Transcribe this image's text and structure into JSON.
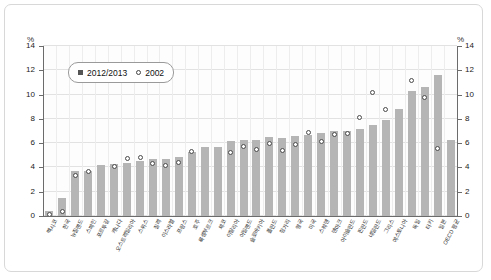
{
  "chart_data": {
    "type": "bar",
    "title": "",
    "xlabel": "",
    "ylabel": "%",
    "ylabel_right": "%",
    "ylim": [
      0,
      14
    ],
    "yticks": [
      0,
      2,
      4,
      6,
      8,
      10,
      12,
      14
    ],
    "grid": true,
    "legend_position": "top-left",
    "categories": [
      "멕시코",
      "한국",
      "뉴질랜드",
      "스페인",
      "포르투갈",
      "캐나다",
      "오스트레일리아",
      "스위스",
      "칠레",
      "이스라엘",
      "프랑스",
      "호주",
      "룩셈부르크",
      "체코",
      "이탈리아",
      "아일랜드",
      "슬로바키아",
      "폴란드",
      "헝가리",
      "영국",
      "미국",
      "스웨덴",
      "덴마크",
      "아이슬란드",
      "핀란드",
      "네덜란드",
      "그리스",
      "에스토니아",
      "독일",
      "터키",
      "일본",
      "OECD 평균"
    ],
    "series": [
      {
        "name": "2012/2013",
        "marker": "square",
        "color": "#b5b5b5",
        "values": [
          0.4,
          1.5,
          3.7,
          3.7,
          4.2,
          4.3,
          4.4,
          4.5,
          4.7,
          4.7,
          4.9,
          5.3,
          5.7,
          5.7,
          6.2,
          6.3,
          6.3,
          6.5,
          6.4,
          6.6,
          6.7,
          6.8,
          7.0,
          7.0,
          7.2,
          7.5,
          7.9,
          8.8,
          10.3,
          10.6,
          11.6,
          6.3
        ]
      },
      {
        "name": "2002",
        "marker": "circle",
        "color": "#ffffff",
        "values": [
          0.1,
          0.4,
          3.3,
          3.7,
          null,
          4.1,
          4.7,
          4.8,
          4.3,
          4.2,
          4.4,
          5.3,
          null,
          null,
          5.2,
          5.7,
          5.5,
          6.0,
          5.4,
          5.9,
          6.9,
          6.1,
          6.7,
          6.8,
          8.1,
          10.2,
          8.8,
          null,
          11.2,
          9.8,
          5.6,
          null
        ]
      }
    ]
  },
  "legend": {
    "items": [
      {
        "label": "2012/2013",
        "marker": "square"
      },
      {
        "label": "2002",
        "marker": "circle"
      }
    ]
  },
  "axes": {
    "unit_left": "%",
    "unit_right": "%",
    "tick_labels": [
      "0",
      "2",
      "4",
      "6",
      "8",
      "10",
      "12",
      "14"
    ]
  }
}
